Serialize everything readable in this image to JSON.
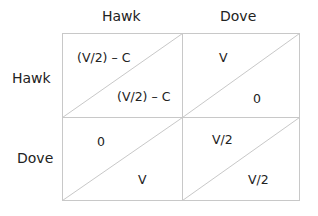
{
  "columns": [
    "Hawk",
    "Dove"
  ],
  "rows": [
    "Hawk",
    "Dove"
  ],
  "cells": [
    [
      {
        "row_payoff": "(V/2) – C",
        "col_payoff": "(V/2) – C"
      },
      {
        "row_payoff": "V",
        "col_payoff": "0"
      }
    ],
    [
      {
        "row_payoff": "0",
        "col_payoff": "V"
      },
      {
        "row_payoff": "V/2",
        "col_payoff": "V/2"
      }
    ]
  ],
  "colors": {
    "grid": "#c8c8c8",
    "text": "#222222"
  }
}
